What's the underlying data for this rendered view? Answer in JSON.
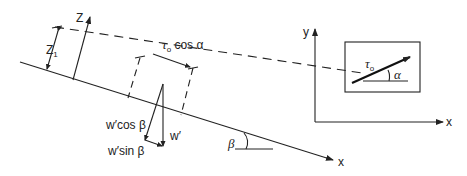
{
  "figure": {
    "left_panel": {
      "axis_z_label": "Z",
      "dimension_label": "Z",
      "dimension_subscript": "1",
      "shear_label_tau": "τ",
      "shear_label_tau_subscript": "o",
      "shear_label_rest": " cos α",
      "weight_label": "w′",
      "weight_normal_label": "w′cos β",
      "weight_tangential_label": "w′sin β",
      "slope_angle_label": "β",
      "axis_x_label": "x"
    },
    "right_panel": {
      "axis_y_label": "y",
      "axis_x_label": "x",
      "vector_label_tau": "τ",
      "vector_label_subscript": "o",
      "angle_label": "α"
    },
    "colors": {
      "line": "#222222",
      "background": "#ffffff"
    }
  }
}
